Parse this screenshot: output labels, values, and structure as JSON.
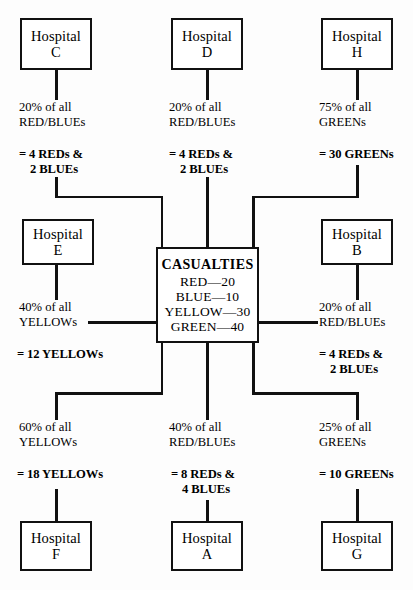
{
  "diagram": {
    "center": {
      "title": "CASUALTIES",
      "lines": [
        "RED—20",
        "BLUE—10",
        "YELLOW—30",
        "GREEN—40"
      ]
    },
    "nodes": {
      "hospital_c": {
        "word": "Hospital",
        "letter": "C"
      },
      "hospital_d": {
        "word": "Hospital",
        "letter": "D"
      },
      "hospital_h": {
        "word": "Hospital",
        "letter": "H"
      },
      "hospital_e": {
        "word": "Hospital",
        "letter": "E"
      },
      "hospital_b": {
        "word": "Hospital",
        "letter": "B"
      },
      "hospital_f": {
        "word": "Hospital",
        "letter": "F"
      },
      "hospital_a": {
        "word": "Hospital",
        "letter": "A"
      },
      "hospital_g": {
        "word": "Hospital",
        "letter": "G"
      }
    },
    "edges": {
      "c": {
        "share_line1": "20% of all",
        "share_line2": "RED/BLUEs",
        "result_line1": "= 4 REDs &",
        "result_line2": "2 BLUEs"
      },
      "d": {
        "share_line1": "20% of all",
        "share_line2": "RED/BLUEs",
        "result_line1": "= 4 REDs &",
        "result_line2": "2 BLUEs"
      },
      "h": {
        "share_line1": "75% of all",
        "share_line2": "GREENs",
        "result_line1": "= 30 GREENs",
        "result_line2": ""
      },
      "e": {
        "share_line1": "40% of all",
        "share_line2": "YELLOWs",
        "result_line1": "= 12 YELLOWs",
        "result_line2": ""
      },
      "b": {
        "share_line1": "20% of all",
        "share_line2": "RED/BLUEs",
        "result_line1": "= 4 REDs &",
        "result_line2": "2 BLUEs"
      },
      "f": {
        "share_line1": "60% of all",
        "share_line2": "YELLOWs",
        "result_line1": "= 18 YELLOWs",
        "result_line2": ""
      },
      "a": {
        "share_line1": "40% of all",
        "share_line2": "RED/BLUEs",
        "result_line1": "= 8 REDs &",
        "result_line2": "4 BLUEs"
      },
      "g": {
        "share_line1": "25% of all",
        "share_line2": "GREENs",
        "result_line1": "= 10 GREENs",
        "result_line2": ""
      }
    },
    "colors": {
      "line": "#111111",
      "background": "#fdfdfd",
      "text": "#000000"
    }
  }
}
